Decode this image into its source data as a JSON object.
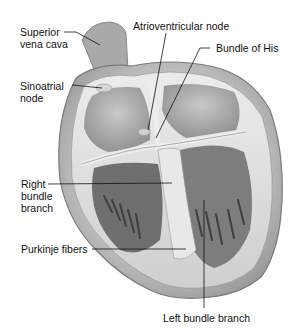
{
  "diagram": {
    "labels": {
      "svc_line1": "Superior",
      "svc_line2": "vena cava",
      "sa_line1": "Sinoatrial",
      "sa_line2": "node",
      "av": "Atrioventricular node",
      "his": "Bundle of His",
      "rbb_line1": "Right",
      "rbb_line2": "bundle",
      "rbb_line3": "branch",
      "purkinje": "Purkinje fibers",
      "lbb": "Left bundle branch"
    },
    "colors": {
      "background": "#ffffff",
      "tissue_light": "#e4e4e4",
      "tissue_mid": "#b8b8b8",
      "tissue_dark": "#5a5a5a",
      "leader_line": "#111111"
    }
  }
}
